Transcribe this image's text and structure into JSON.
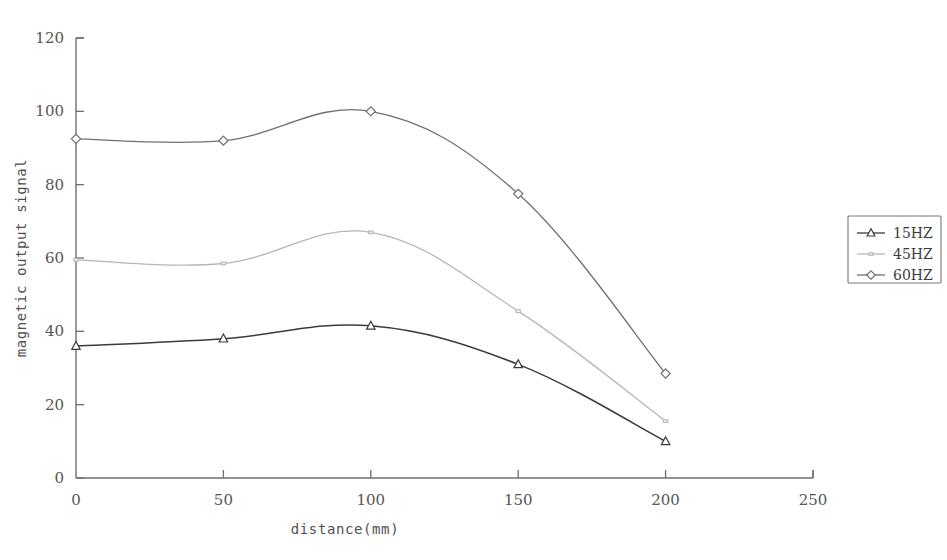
{
  "chart_data": {
    "type": "line",
    "title": "",
    "xlabel": "distance(mm)",
    "ylabel": "magnetic output signal",
    "xlim": [
      0,
      250
    ],
    "ylim": [
      0,
      120
    ],
    "xticks": [
      0,
      50,
      100,
      150,
      200,
      250
    ],
    "yticks": [
      0,
      20,
      40,
      60,
      80,
      100,
      120
    ],
    "xtick_labels": [
      "0",
      "50",
      "100",
      "150",
      "200",
      "250"
    ],
    "ytick_labels": [
      "0",
      "20",
      "40",
      "60",
      "80",
      "100",
      "120"
    ],
    "grid": false,
    "legend_position": "right-outside",
    "x": [
      0,
      50,
      100,
      150,
      200
    ],
    "series": [
      {
        "name": "15HZ",
        "marker": "triangle",
        "color": "#3a3a3a",
        "values": [
          36,
          38,
          41.5,
          31,
          10
        ]
      },
      {
        "name": "45HZ",
        "marker": "square",
        "color": "#b6b6b6",
        "values": [
          59.5,
          58.5,
          67,
          45.5,
          15.5
        ]
      },
      {
        "name": "60HZ",
        "marker": "diamond",
        "color": "#707070",
        "values": [
          92.5,
          92,
          100,
          77.5,
          28.5
        ]
      }
    ]
  },
  "axis": {
    "x_title": "distance(mm)",
    "y_title": "magnetic output signal"
  },
  "legend": {
    "entries": [
      {
        "label": "15HZ"
      },
      {
        "label": "45HZ"
      },
      {
        "label": "60HZ"
      }
    ]
  },
  "colors": {
    "axis": "#6e6e6e",
    "series_15hz": "#3a3a3a",
    "series_45hz": "#b6b6b6",
    "series_60hz": "#707070",
    "background": "#ffffff"
  }
}
